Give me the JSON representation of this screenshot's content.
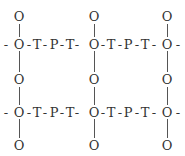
{
  "diagram": {
    "atoms": {
      "top": [
        "O",
        "O",
        "O"
      ],
      "row1": "-O-T-P-T-O-T-P-T-O-",
      "middle": [
        "O",
        "O",
        "O"
      ],
      "row2": "-O-T-P-T-O-T-P-T-O-",
      "bottom": [
        "O",
        "O",
        "O"
      ]
    },
    "rows": [
      {
        "y": 44,
        "items": [
          {
            "x": 6,
            "label": "-"
          },
          {
            "x": 19,
            "label": "O"
          },
          {
            "x": 29,
            "label": "-"
          },
          {
            "x": 37,
            "label": "T"
          },
          {
            "x": 45,
            "label": "-"
          },
          {
            "x": 54,
            "label": "P"
          },
          {
            "x": 62,
            "label": "-"
          },
          {
            "x": 70,
            "label": "T"
          },
          {
            "x": 77,
            "label": "-"
          },
          {
            "x": 94,
            "label": "O"
          },
          {
            "x": 103,
            "label": "-"
          },
          {
            "x": 111,
            "label": "T"
          },
          {
            "x": 120,
            "label": "-"
          },
          {
            "x": 128,
            "label": "P"
          },
          {
            "x": 137,
            "label": "-"
          },
          {
            "x": 145,
            "label": "T"
          },
          {
            "x": 154,
            "label": "-"
          },
          {
            "x": 167,
            "label": "O"
          },
          {
            "x": 178,
            "label": "-"
          }
        ]
      },
      {
        "y": 112,
        "items": [
          {
            "x": 6,
            "label": "-"
          },
          {
            "x": 19,
            "label": "O"
          },
          {
            "x": 29,
            "label": "-"
          },
          {
            "x": 37,
            "label": "T"
          },
          {
            "x": 45,
            "label": "-"
          },
          {
            "x": 54,
            "label": "P"
          },
          {
            "x": 62,
            "label": "-"
          },
          {
            "x": 70,
            "label": "T"
          },
          {
            "x": 77,
            "label": "-"
          },
          {
            "x": 94,
            "label": "O"
          },
          {
            "x": 103,
            "label": "-"
          },
          {
            "x": 111,
            "label": "T"
          },
          {
            "x": 120,
            "label": "-"
          },
          {
            "x": 128,
            "label": "P"
          },
          {
            "x": 137,
            "label": "-"
          },
          {
            "x": 145,
            "label": "T"
          },
          {
            "x": 154,
            "label": "-"
          },
          {
            "x": 167,
            "label": "O"
          },
          {
            "x": 178,
            "label": "-"
          }
        ]
      }
    ],
    "pendant": {
      "label": "O",
      "columns": [
        19,
        94,
        167
      ],
      "ys": [
        16,
        79,
        145
      ]
    }
  }
}
